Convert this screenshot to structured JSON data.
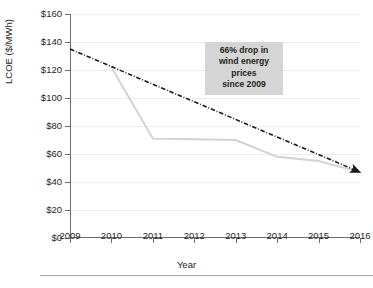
{
  "chart_data": {
    "type": "line",
    "title": "",
    "xlabel": "Year",
    "ylabel": "LCOE ($/MWh)",
    "x": [
      2009,
      2010,
      2011,
      2012,
      2013,
      2014,
      2015,
      2016
    ],
    "xticklabels": [
      "2009",
      "2010",
      "2011",
      "2012",
      "2013",
      "2014",
      "2015",
      "2016"
    ],
    "xlim": [
      2009,
      2016
    ],
    "ylim": [
      0,
      160
    ],
    "yticks": [
      0,
      20,
      40,
      60,
      80,
      100,
      120,
      140,
      160
    ],
    "yticklabels": [
      "$0",
      "$20",
      "$40",
      "$60",
      "$80",
      "$100",
      "$120",
      "$140",
      "$160"
    ],
    "grid": "horizontal",
    "legend": "none",
    "series": [
      {
        "name": "wind-lcoe-actual",
        "style": "solid",
        "color": "#d2d2d2",
        "x": [
          2010,
          2011,
          2012,
          2013,
          2014,
          2015,
          2016
        ],
        "values": [
          122,
          71,
          70.5,
          70,
          58,
          55,
          47
        ]
      },
      {
        "name": "wind-lcoe-trend",
        "style": "dash-dot",
        "color": "#1a1a1a",
        "arrow_end": true,
        "x": [
          2009,
          2016
        ],
        "values": [
          135,
          47
        ]
      }
    ],
    "annotations": [
      {
        "name": "drop-callout",
        "lines": [
          "66% drop in",
          "wind energy",
          "prices",
          "since 2009"
        ],
        "background": "#d5d5d5"
      }
    ]
  },
  "annotation": {
    "line1": "66% drop in",
    "line2": "wind energy",
    "line3": "prices",
    "line4": "since 2009"
  },
  "axes": {
    "y_title": "LCOE ($/MWh)",
    "x_title": "Year"
  },
  "caption": {
    "text": ""
  },
  "colors": {
    "actual_series": "#d2d2d2",
    "trend_series": "#1a1a1a",
    "annotation_bg": "#d5d5d5",
    "axis": "#6d6e71",
    "grid": "#ececec"
  }
}
